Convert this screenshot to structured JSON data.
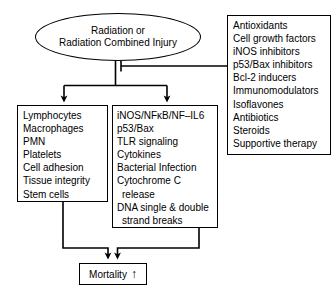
{
  "figure": {
    "stroke_color": "#000000",
    "background_color": "#ffffff"
  },
  "source_node": {
    "name": "radiation-source",
    "shape": "ellipse",
    "lines": [
      "Radiation or",
      "Radiation Combined Injury"
    ]
  },
  "treatments_box": {
    "name": "treatments",
    "shape": "rectangle",
    "items": [
      "Antioxidants",
      "Cell growth factors",
      "iNOS inhibitors",
      "p53/Bax inhibitors",
      "Bcl-2 inducers",
      "Immunomodulators",
      "Isoflavones",
      "Antibiotics",
      "Steroids",
      "Supportive therapy"
    ]
  },
  "effects_box": {
    "name": "decreased-cell-populations",
    "shape": "rectangle",
    "trend_arrow": "down",
    "items": [
      "Lymphocytes",
      "Macrophages",
      "PMN",
      "Platelets",
      "Cell adhesion",
      "Tissue integrity",
      "Stem cells"
    ]
  },
  "mediators_box": {
    "name": "increased-molecular-mediators",
    "shape": "rectangle",
    "trend_arrow": "up",
    "items": [
      {
        "text": "iNOS/NFκB/NF–IL6",
        "indent": false
      },
      {
        "text": "p53/Bax",
        "indent": false
      },
      {
        "text": "TLR signaling",
        "indent": false
      },
      {
        "text": "Cytokines",
        "indent": false
      },
      {
        "text": "Bacterial Infection",
        "indent": false
      },
      {
        "text": "Cytochrome C",
        "indent": false
      },
      {
        "text": "release",
        "indent": true
      },
      {
        "text": "DNA single & double",
        "indent": false
      },
      {
        "text": "strand breaks",
        "indent": true
      }
    ]
  },
  "outcome_box": {
    "name": "mortality",
    "shape": "rectangle",
    "label": "Mortality",
    "trend_arrow": "↑"
  },
  "connectors": [
    {
      "name": "source-to-split",
      "type": "line",
      "from": "radiation-source",
      "to": "split-junction"
    },
    {
      "name": "split-to-effects",
      "type": "arrow",
      "from": "split-junction",
      "to": "decreased-cell-populations"
    },
    {
      "name": "split-to-mediators",
      "type": "arrow",
      "from": "split-junction",
      "to": "increased-molecular-mediators"
    },
    {
      "name": "treatments-inhibition",
      "type": "inhibition",
      "from": "treatments",
      "to": "split-junction"
    },
    {
      "name": "effects-to-mortality",
      "type": "arrow",
      "from": "decreased-cell-populations",
      "to": "mortality"
    },
    {
      "name": "mediators-to-mortality",
      "type": "arrow",
      "from": "increased-molecular-mediators",
      "to": "mortality"
    }
  ]
}
